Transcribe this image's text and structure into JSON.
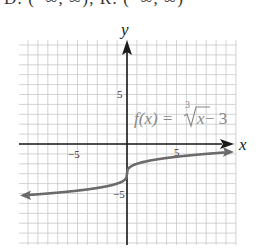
{
  "header": {
    "cropped_text": "D: (−∞, ∞); R: (−∞, ∞)"
  },
  "chart_data": {
    "type": "line",
    "title": "",
    "function_label": "f(x) = ∛x − 3",
    "function_label_parts": {
      "prefix": "f(x) = ",
      "root_index": "3",
      "radicand": "x",
      "suffix": " − 3"
    },
    "xlabel": "x",
    "ylabel": "y",
    "xlim": [
      -11,
      11
    ],
    "ylim": [
      -10,
      10
    ],
    "x_tick_labels": [
      {
        "value": -5,
        "label": "−5"
      },
      {
        "value": 5,
        "label": "5"
      }
    ],
    "y_tick_labels": [
      {
        "value": 5,
        "label": "5"
      },
      {
        "value": -5,
        "label": "−5"
      }
    ],
    "grid": true,
    "grid_step": 1,
    "series": [
      {
        "name": "f(x) = ∛x − 3",
        "x": [
          -10,
          -8,
          -6,
          -4,
          -2,
          -1,
          -0.5,
          -0.125,
          0,
          0.125,
          0.5,
          1,
          2,
          4,
          6,
          8,
          10
        ],
        "values": [
          -5.15,
          -5,
          -4.82,
          -4.59,
          -4.26,
          -4,
          -3.79,
          -3.5,
          -3,
          -2.5,
          -2.21,
          -2,
          -1.74,
          -1.41,
          -1.18,
          -1,
          -0.85
        ]
      }
    ],
    "colors": {
      "curve": "#6b6b6b",
      "axis": "#1a1a1a",
      "grid": "#c8c8c8"
    }
  }
}
